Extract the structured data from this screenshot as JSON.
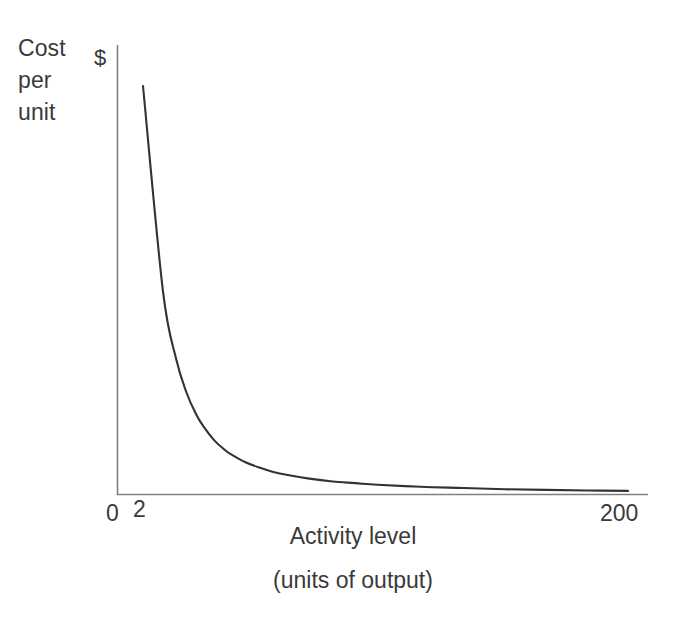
{
  "chart_data": {
    "type": "line",
    "title": "",
    "subtitle": "",
    "ylabel_lines": [
      "Cost",
      "per",
      "unit"
    ],
    "y_unit_label": "$",
    "xlabel_lines": [
      "Activity level",
      "(units of output)"
    ],
    "xlabel": "Activity level (units of output)",
    "ylabel": "Cost per unit",
    "grid": false,
    "legend": "none",
    "axis_origin_label": "0",
    "x_tick_labels": [
      "2",
      "200"
    ],
    "y_tick_labels": [],
    "xlim": [
      2,
      200
    ],
    "ylim": [
      0,
      100
    ],
    "series": [
      {
        "name": "Fixed cost per unit",
        "relationship": "y = k / x",
        "x": [
          2,
          4,
          6,
          8,
          10,
          12,
          15,
          18,
          20,
          25,
          30,
          35,
          40,
          50,
          60,
          70,
          80,
          100,
          120,
          140,
          160,
          180,
          200
        ],
        "values": [
          100,
          50,
          33.3,
          25,
          20,
          16.7,
          13.3,
          11.1,
          10,
          8,
          6.7,
          5.7,
          5,
          4,
          3.3,
          2.9,
          2.5,
          2,
          1.7,
          1.4,
          1.25,
          1.1,
          1
        ]
      }
    ],
    "annotations": [],
    "curve_color": "#333333",
    "axis_color": "#808080",
    "text_color": "#3a3a3a",
    "background_color": "#ffffff"
  },
  "axes": {
    "y_axis_name": "cost-per-unit-axis",
    "x_axis_name": "activity-level-axis"
  }
}
